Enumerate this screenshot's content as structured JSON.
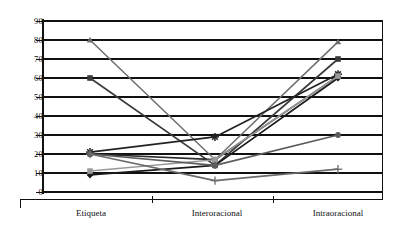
{
  "chart_data": {
    "type": "line",
    "title": "",
    "subtitle": "",
    "xlabel": "",
    "ylabel": "",
    "categories": [
      "Etiqueta",
      "Interoracional",
      "Intraoracional"
    ],
    "ylim": [
      0,
      90
    ],
    "yticks": [
      0,
      10,
      20,
      30,
      40,
      50,
      60,
      70,
      80,
      90
    ],
    "ytick_labels": [
      "0",
      "10",
      "20",
      "30",
      "40",
      "50",
      "60",
      "70",
      "80",
      "90"
    ],
    "grid": "horizontal",
    "legend": "none",
    "series": [
      {
        "name": "serie-1",
        "marker": "triangle",
        "color": "#6e6e6e",
        "values": [
          80,
          17,
          79
        ]
      },
      {
        "name": "serie-2",
        "marker": "square",
        "color": "#3a3a3a",
        "values": [
          60,
          14,
          70
        ]
      },
      {
        "name": "serie-3",
        "marker": "star",
        "color": "#222222",
        "values": [
          21,
          29,
          62
        ]
      },
      {
        "name": "serie-4",
        "marker": "circle",
        "color": "#2b2b2b",
        "values": [
          20,
          17,
          61
        ]
      },
      {
        "name": "serie-5",
        "marker": "diamond",
        "color": "#1a1a1a",
        "values": [
          9,
          14,
          60
        ]
      },
      {
        "name": "serie-6",
        "marker": "square-gray",
        "color": "#9a9a9a",
        "values": [
          11,
          17,
          61
        ]
      },
      {
        "name": "serie-7",
        "marker": "dot",
        "color": "#5c5c5c",
        "values": [
          20,
          14,
          30
        ]
      },
      {
        "name": "serie-8",
        "marker": "plus",
        "color": "#6b6b6b",
        "values": [
          20,
          6,
          12
        ]
      }
    ]
  },
  "axis": {
    "x_categories": [
      "Etiqueta",
      "Interoracional",
      "Intraoracional"
    ],
    "y_labels": [
      "90",
      "80",
      "70",
      "60",
      "50",
      "40",
      "30",
      "20",
      "10",
      "0"
    ]
  }
}
